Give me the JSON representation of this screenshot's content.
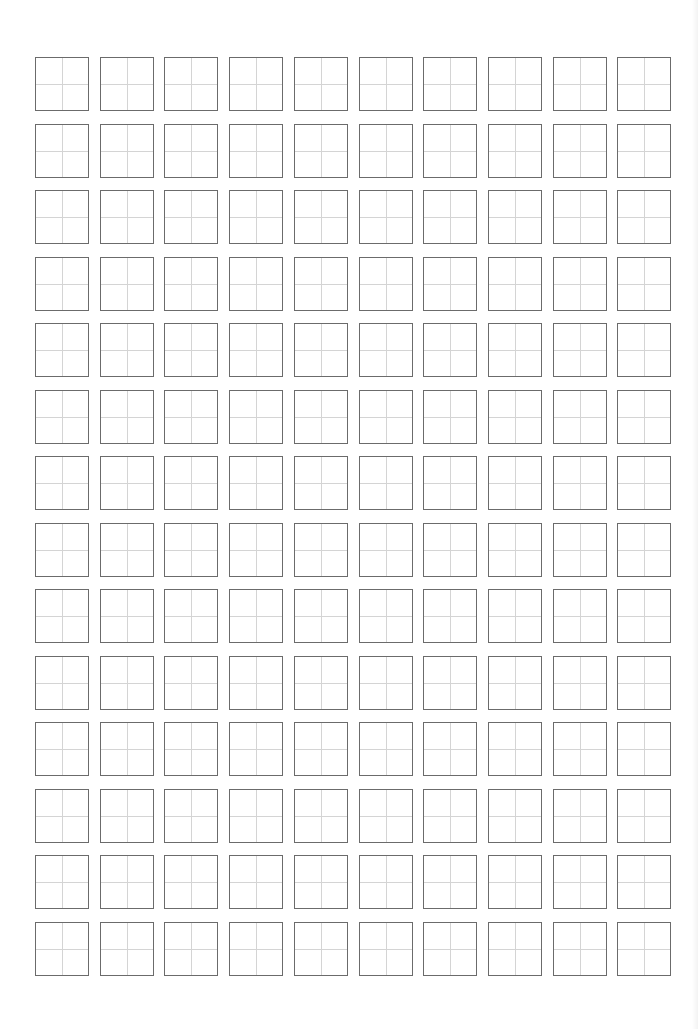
{
  "sheet": {
    "type": "tianzige-practice-grid",
    "rows": 14,
    "columns": 10,
    "origin": {
      "x": 35,
      "y": 57
    },
    "cell_size": 54,
    "column_pitch": 64.7,
    "row_pitch": 66.5,
    "colors": {
      "background": "#ffffff",
      "cell_border": "#6b6b6b",
      "guide_line": "#d4d4d4"
    },
    "cells_content": []
  }
}
